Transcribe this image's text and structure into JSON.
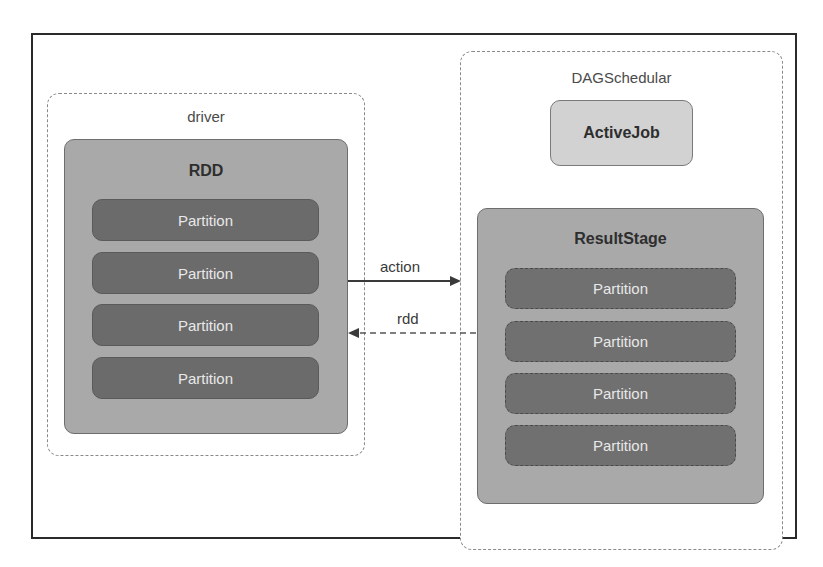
{
  "driver": {
    "label": "driver",
    "rdd": {
      "title": "RDD",
      "partitions": [
        "Partition",
        "Partition",
        "Partition",
        "Partition"
      ]
    }
  },
  "scheduler": {
    "label": "DAGSchedular",
    "active_job": {
      "title": "ActiveJob"
    },
    "result_stage": {
      "title": "ResultStage",
      "partitions": [
        "Partition",
        "Partition",
        "Partition",
        "Partition"
      ]
    }
  },
  "edges": {
    "action": {
      "label": "action",
      "from": "driver.RDD",
      "to": "DAGSchedular",
      "style": "solid"
    },
    "rdd": {
      "label": "rdd",
      "from": "DAGSchedular.ResultStage",
      "to": "driver.RDD",
      "style": "dashed"
    }
  },
  "colors": {
    "container_fill": "#a9a9a9",
    "partition_fill": "#6b6b6b",
    "job_fill": "#d2d2d2",
    "frame": "#2a2a2a"
  }
}
